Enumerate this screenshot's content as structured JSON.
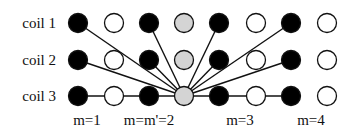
{
  "diagram": {
    "rows": [
      {
        "label": "coil 1",
        "y": 23
      },
      {
        "label": "coil 2",
        "y": 60
      },
      {
        "label": "coil 3",
        "y": 96
      }
    ],
    "columns_x": [
      78,
      114,
      149,
      184,
      219,
      256,
      291,
      327
    ],
    "grid": [
      [
        "black",
        "white",
        "black",
        "gray",
        "black",
        "white",
        "black",
        "white"
      ],
      [
        "black",
        "white",
        "black",
        "gray",
        "black",
        "white",
        "black",
        "white"
      ],
      [
        "black",
        "white",
        "black",
        "gray",
        "black",
        "white",
        "black",
        "white"
      ]
    ],
    "hub": {
      "row": 2,
      "col": 3
    },
    "connections": [
      {
        "row": 0,
        "col": 0
      },
      {
        "row": 1,
        "col": 0
      },
      {
        "row": 2,
        "col": 0
      },
      {
        "row": 0,
        "col": 2
      },
      {
        "row": 1,
        "col": 2
      },
      {
        "row": 0,
        "col": 4
      },
      {
        "row": 1,
        "col": 4
      },
      {
        "row": 0,
        "col": 6
      },
      {
        "row": 1,
        "col": 6
      },
      {
        "row": 2,
        "col": 6
      }
    ],
    "bottom_labels": [
      {
        "text": "m=1",
        "x": 87
      },
      {
        "text": "m=m'=2",
        "x": 149
      },
      {
        "text": "m=3",
        "x": 240
      },
      {
        "text": "m=4",
        "x": 311
      }
    ],
    "colors": {
      "black": "#000000",
      "white": "#ffffff",
      "gray": "#d4d4d4",
      "stroke": "#111111"
    }
  }
}
